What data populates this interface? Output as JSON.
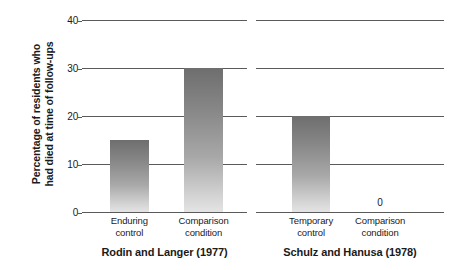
{
  "chart_data": {
    "type": "bar",
    "title": "",
    "subtitle": "",
    "xlabel": "",
    "ylabel_line1": "Percentage of residents who",
    "ylabel_line2": "had died at time of follow-ups",
    "ylim": [
      0,
      40
    ],
    "yticks": [
      0,
      10,
      20,
      30,
      40
    ],
    "ytick_labels": [
      "0",
      "10",
      "20",
      "30",
      "40"
    ],
    "grid": true,
    "grid_axis": "y",
    "legend": false,
    "legend_position": "none",
    "bar_color_top": "#6e6e6e",
    "bar_color_bottom": "#e4e4e4",
    "axis_color": "#5a5a5a",
    "panels": [
      {
        "title": "Rodin and Langer (1977)",
        "categories": [
          "Enduring control",
          "Comparison condition"
        ],
        "category_lines": [
          [
            "Enduring",
            "control"
          ],
          [
            "Comparison",
            "condition"
          ]
        ],
        "values": [
          15,
          30
        ],
        "value_labels": [
          "",
          ""
        ]
      },
      {
        "title": "Schulz and Hanusa (1978)",
        "categories": [
          "Temporary control",
          "Comparison condition"
        ],
        "category_lines": [
          [
            "Temporary",
            "control"
          ],
          [
            "Comparison",
            "condition"
          ]
        ],
        "values": [
          20,
          0
        ],
        "value_labels": [
          "",
          "0"
        ]
      }
    ]
  }
}
